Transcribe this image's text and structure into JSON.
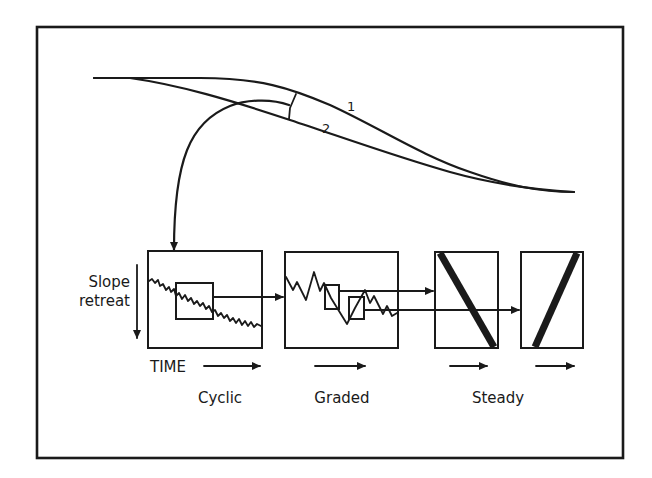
{
  "diagram": {
    "curve_labels": {
      "profile_1": "1",
      "profile_2": "2"
    },
    "axis": {
      "vertical_label_line1": "Slope",
      "vertical_label_line2": "retreat",
      "time_label": "TIME"
    },
    "panels": [
      {
        "id": "cyclic",
        "label": "Cyclic"
      },
      {
        "id": "graded",
        "label": "Graded"
      },
      {
        "id": "steady-1",
        "label": "Steady"
      },
      {
        "id": "steady-2",
        "label": ""
      }
    ],
    "colors": {
      "ink": "#1a1a1a",
      "background": "#ffffff"
    }
  }
}
